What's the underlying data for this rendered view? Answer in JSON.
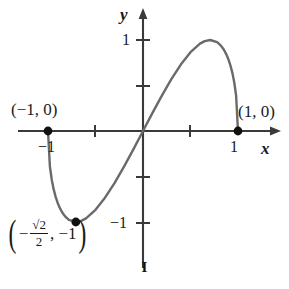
{
  "figure": {
    "caption": "I",
    "background_color": "#ffffff",
    "curve_color": "#6a6a6a",
    "axis_color": "#3a3a3a",
    "point_color": "#111111"
  },
  "axes": {
    "x_name": "x",
    "y_name": "y",
    "x_ticks": [
      {
        "value": -1,
        "label": "−1"
      },
      {
        "value": -0.5,
        "label": ""
      },
      {
        "value": 0.5,
        "label": ""
      },
      {
        "value": 1,
        "label": "1"
      }
    ],
    "y_ticks": [
      {
        "value": 1,
        "label": "1"
      },
      {
        "value": 0.5,
        "label": ""
      },
      {
        "value": -0.5,
        "label": ""
      },
      {
        "value": -1,
        "label": "−1"
      }
    ],
    "xlim": [
      -1.45,
      1.45
    ],
    "ylim": [
      -1.45,
      1.45
    ],
    "grid": false,
    "arrows": [
      "x-positive",
      "y-positive"
    ]
  },
  "annotations": {
    "left_intercept": "(−1, 0)",
    "right_intercept": "(1, 0)",
    "minimum": {
      "open_paren": "(",
      "minus": "−",
      "numerator": "√2",
      "denominator": "2",
      "rest": ", −1",
      "close_paren": ")"
    }
  },
  "chart_data": {
    "type": "line",
    "title": "I",
    "xlabel": "x",
    "ylabel": "y",
    "xlim": [
      -1.45,
      1.45
    ],
    "ylim": [
      -1.45,
      1.45
    ],
    "grid": false,
    "legend": null,
    "xticks": [
      -1,
      -0.5,
      0.5,
      1
    ],
    "xticklabels": [
      "−1",
      "",
      "",
      "1"
    ],
    "yticks": [
      -1,
      -0.5,
      0.5,
      1
    ],
    "yticklabels": [
      "−1",
      "",
      "",
      "1"
    ],
    "series": [
      {
        "name": "y = 2x√(1−x²)",
        "x": [
          -1.0,
          -0.98,
          -0.96,
          -0.94,
          -0.92,
          -0.9,
          -0.88,
          -0.85,
          -0.82,
          -0.78,
          -0.7071,
          -0.65,
          -0.6,
          -0.5,
          -0.4,
          -0.3,
          -0.2,
          -0.1,
          0.0,
          0.1,
          0.2,
          0.3,
          0.4,
          0.5,
          0.6,
          0.65,
          0.7071,
          0.78,
          0.82,
          0.85,
          0.88,
          0.9,
          0.92,
          0.94,
          0.96,
          0.98,
          1.0
        ],
        "y": [
          0.0,
          -0.39,
          -0.538,
          -0.642,
          -0.721,
          -0.785,
          -0.836,
          -0.895,
          -0.938,
          -0.976,
          -1.0,
          -0.988,
          -0.96,
          -0.866,
          -0.733,
          -0.572,
          -0.392,
          -0.199,
          0.0,
          0.199,
          0.392,
          0.572,
          0.733,
          0.866,
          0.96,
          0.988,
          1.0,
          0.976,
          0.938,
          0.895,
          0.836,
          0.785,
          0.721,
          0.642,
          0.538,
          0.39,
          0.0
        ]
      }
    ],
    "points": [
      {
        "x": -1,
        "y": 0,
        "label": "(−1, 0)"
      },
      {
        "x": 1,
        "y": 0,
        "label": "(1, 0)"
      },
      {
        "x": -0.7071,
        "y": -1,
        "label": "(−√2/2, −1)"
      }
    ]
  }
}
